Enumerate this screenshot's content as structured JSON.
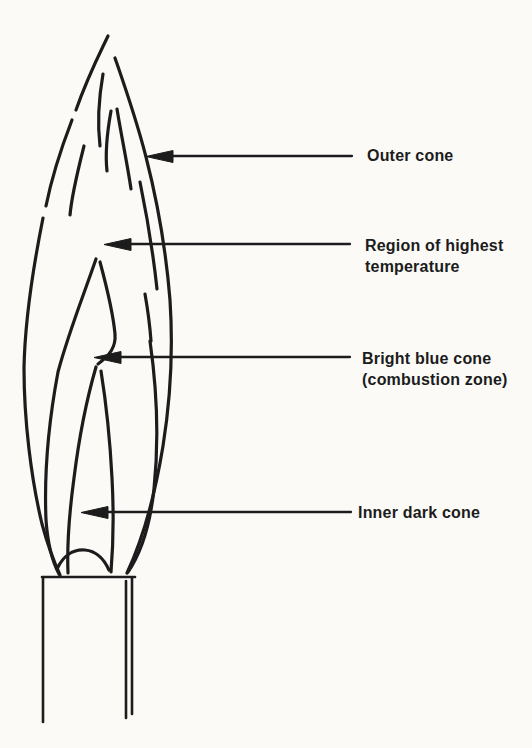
{
  "colors": {
    "paper": "#fbfaf7",
    "ink": "#1c1c1c"
  },
  "figure": {
    "kind": "flame-structure-diagram",
    "annotations": [
      {
        "target": "outer-cone",
        "lines": [
          "Outer cone",
          ""
        ]
      },
      {
        "target": "region-of-highest-temperature",
        "lines": [
          "Region of highest",
          "temperature"
        ]
      },
      {
        "target": "bright-blue-cone-combustion-zone",
        "lines": [
          "Bright blue cone",
          "(combustion zone)"
        ]
      },
      {
        "target": "inner-dark-cone",
        "lines": [
          "Inner dark cone",
          ""
        ]
      }
    ]
  }
}
